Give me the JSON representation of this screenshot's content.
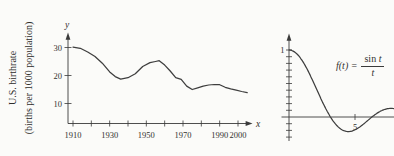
{
  "figure": {
    "background_color": "#fbfbf9",
    "ink_color": "#3a3a3a"
  },
  "chart_data": [
    {
      "type": "line",
      "id": "us-birthrate",
      "title": "U.S. birthrate",
      "ylabel": "U.S. birthrate (births per 1000 population)",
      "ylabel_lines": [
        "U.S. birthrate",
        "(births per 1000 population)"
      ],
      "y_axis_letter": "y",
      "x_axis_letter": "x",
      "x_ticks": [
        1910,
        1920,
        1930,
        1940,
        1950,
        1960,
        1970,
        1980,
        1990,
        2000
      ],
      "x_tick_labels": [
        "1910",
        "",
        "1930",
        "",
        "1950",
        "",
        "1970",
        "",
        "1990",
        "2000"
      ],
      "y_ticks": [
        10,
        20,
        30
      ],
      "y_tick_labels": [
        "10",
        "20",
        "30"
      ],
      "xlim": [
        1910,
        2006
      ],
      "ylim": [
        0,
        33
      ],
      "grid": false,
      "x": [
        1910,
        1914,
        1918,
        1922,
        1926,
        1930,
        1933,
        1936,
        1940,
        1944,
        1948,
        1952,
        1955,
        1957,
        1960,
        1963,
        1966,
        1969,
        1972,
        1975,
        1978,
        1981,
        1984,
        1987,
        1990,
        1993,
        1996,
        1999,
        2002,
        2005
      ],
      "values": [
        30.1,
        29.7,
        28.4,
        26.8,
        24.4,
        21.3,
        19.6,
        18.7,
        19.2,
        20.6,
        23.2,
        24.6,
        25.0,
        25.3,
        23.7,
        21.6,
        19.2,
        18.6,
        16.2,
        15.0,
        15.6,
        16.2,
        16.6,
        16.8,
        16.7,
        15.8,
        15.2,
        14.8,
        14.3,
        13.9
      ]
    },
    {
      "type": "line",
      "id": "sinc-function",
      "formula": {
        "full": "f(t) = sin t / t",
        "lhs": "f(t) =",
        "numerator_fn": "sin",
        "numerator_var": "t",
        "denominator": "t"
      },
      "function": "sin(t)/t",
      "t_range": [
        0.02,
        7.95
      ],
      "y_labeled_ticks": [
        {
          "value": 1,
          "label": "1"
        }
      ],
      "x_labeled_ticks": [
        {
          "value": 5,
          "label": "5"
        }
      ],
      "minor_y_ticks": {
        "start": -0.3,
        "end": 1.0,
        "step": 0.1
      },
      "xlim": [
        0,
        8
      ],
      "ylim": [
        -0.35,
        1.1
      ],
      "grid": false
    }
  ]
}
